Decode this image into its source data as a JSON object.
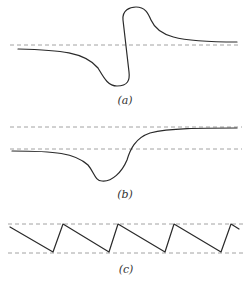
{
  "figure": {
    "panels": [
      {
        "id": "a",
        "label": "(a)",
        "reference_lines": [
          "baseline"
        ],
        "description": "S-shaped curve crossing a dashed baseline with a loop above and below"
      },
      {
        "id": "b",
        "label": "(b)",
        "reference_lines": [
          "upper-level",
          "lower-level"
        ],
        "description": "Curve dipping below lower dashed level then rising to upper dashed level"
      },
      {
        "id": "c",
        "label": "(c)",
        "reference_lines": [
          "upper-bound",
          "lower-bound"
        ],
        "description": "Sawtooth oscillation between two dashed bounds"
      }
    ],
    "colors": {
      "curve": "#2a2a2a",
      "dashed": "#8a8a8a",
      "background": "#ffffff"
    }
  }
}
